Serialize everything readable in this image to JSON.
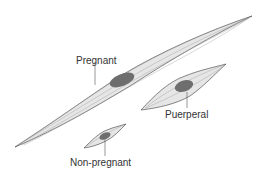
{
  "diagram": {
    "cells": [
      {
        "id": "pregnant",
        "label": "Pregnant"
      },
      {
        "id": "puerperal",
        "label": "Puerperal"
      },
      {
        "id": "non-pregnant",
        "label": "Non-pregnant"
      }
    ],
    "colors": {
      "cell_fill": "#e6e6e6",
      "cell_stroke": "#555555",
      "fibril": "#9a9a9a",
      "nucleus": "#6e6e6e",
      "leader": "#555555"
    }
  }
}
